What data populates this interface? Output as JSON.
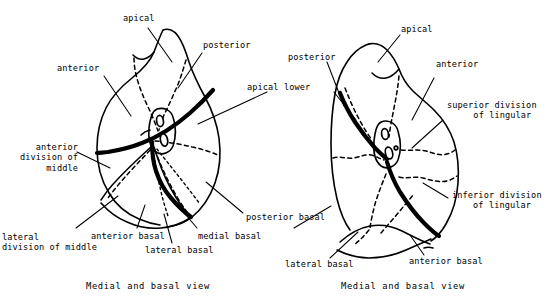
{
  "figure": {
    "background_color": "#ffffff",
    "ink_color": "#000000",
    "panel_count": 2
  },
  "panels": [
    {
      "id": "right-lung",
      "caption": "Medial and basal view",
      "labels": [
        {
          "key": "apical",
          "text": "apical",
          "align": "left"
        },
        {
          "key": "posterior",
          "text": "posterior",
          "align": "left"
        },
        {
          "key": "anterior",
          "text": "anterior",
          "align": "left"
        },
        {
          "key": "apical_lower",
          "text": "apical lower",
          "align": "left"
        },
        {
          "key": "ant_div_middle",
          "text": "anterior\ndivision of\nmiddle",
          "align": "right"
        },
        {
          "key": "lat_div_middle",
          "text": "lateral\ndivision of middle",
          "align": "left"
        },
        {
          "key": "anterior_basal",
          "text": "anterior basal",
          "align": "left"
        },
        {
          "key": "lateral_basal",
          "text": "lateral basal",
          "align": "left"
        },
        {
          "key": "medial_basal",
          "text": "medial basal",
          "align": "left"
        },
        {
          "key": "posterior_basal",
          "text": "posterior basal",
          "align": "left"
        }
      ]
    },
    {
      "id": "left-lung",
      "caption": "Medial and basal view",
      "labels": [
        {
          "key": "apical",
          "text": "apical",
          "align": "left"
        },
        {
          "key": "posterior",
          "text": "posterior",
          "align": "left"
        },
        {
          "key": "anterior",
          "text": "anterior",
          "align": "left"
        },
        {
          "key": "sup_lingular",
          "text": "superior division\n     of lingular",
          "align": "left"
        },
        {
          "key": "inf_lingular",
          "text": "inferior division\n    of lingular",
          "align": "left"
        },
        {
          "key": "lateral_basal",
          "text": "lateral basal",
          "align": "left"
        },
        {
          "key": "anterior_basal",
          "text": "anterior basal",
          "align": "left"
        }
      ]
    }
  ],
  "captions": {
    "left": "Medial and basal view",
    "right": "Medial and basal view"
  }
}
